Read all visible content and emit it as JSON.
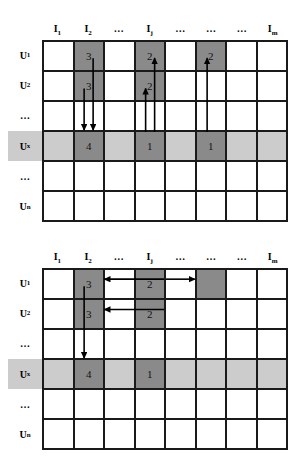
{
  "figure": {
    "colors": {
      "dark_cell": "#8a8a8a",
      "band_highlight": "#cccccc",
      "grid_line": "#1a1a1a",
      "background": "#ffffff",
      "arrow": "#000000"
    }
  },
  "column_headers": [
    {
      "text": "I",
      "sub": "1"
    },
    {
      "text": "I",
      "sub": "2"
    },
    {
      "text": "…",
      "sub": ""
    },
    {
      "text": "I",
      "sub": "j"
    },
    {
      "text": "…",
      "sub": ""
    },
    {
      "text": "…",
      "sub": ""
    },
    {
      "text": "…",
      "sub": ""
    },
    {
      "text": "I",
      "sub": "m"
    }
  ],
  "row_labels": [
    {
      "text": "U",
      "sub": "1",
      "highlight": false
    },
    {
      "text": "U",
      "sub": "2",
      "highlight": false
    },
    {
      "text": "…",
      "sub": "",
      "highlight": false
    },
    {
      "text": "U",
      "sub": "x",
      "highlight": true
    },
    {
      "text": "…",
      "sub": "",
      "highlight": false
    },
    {
      "text": "U",
      "sub": "n",
      "highlight": false
    }
  ],
  "diagrams": [
    {
      "id": "top",
      "name": "user-based-collaborative-filtering",
      "band_row_index": 3,
      "rows": [
        {
          "cells": [
            {
              "value": "",
              "dark": false
            },
            {
              "value": "3",
              "dark": true
            },
            {
              "value": "",
              "dark": false
            },
            {
              "value": "2",
              "dark": true
            },
            {
              "value": "",
              "dark": false
            },
            {
              "value": "2",
              "dark": true
            },
            {
              "value": "",
              "dark": false
            },
            {
              "value": "",
              "dark": false
            }
          ]
        },
        {
          "cells": [
            {
              "value": "",
              "dark": false
            },
            {
              "value": "3",
              "dark": true
            },
            {
              "value": "",
              "dark": false
            },
            {
              "value": "2",
              "dark": true
            },
            {
              "value": "",
              "dark": false
            },
            {
              "value": "",
              "dark": false
            },
            {
              "value": "",
              "dark": false
            },
            {
              "value": "",
              "dark": false
            }
          ]
        },
        {
          "cells": [
            {
              "value": "",
              "dark": false
            },
            {
              "value": "",
              "dark": false
            },
            {
              "value": "",
              "dark": false
            },
            {
              "value": "",
              "dark": false
            },
            {
              "value": "",
              "dark": false
            },
            {
              "value": "",
              "dark": false
            },
            {
              "value": "",
              "dark": false
            },
            {
              "value": "",
              "dark": false
            }
          ]
        },
        {
          "cells": [
            {
              "value": "",
              "dark": false
            },
            {
              "value": "4",
              "dark": true
            },
            {
              "value": "",
              "dark": false
            },
            {
              "value": "1",
              "dark": true
            },
            {
              "value": "",
              "dark": false
            },
            {
              "value": "1",
              "dark": true
            },
            {
              "value": "",
              "dark": false
            },
            {
              "value": "",
              "dark": false
            }
          ]
        },
        {
          "cells": [
            {
              "value": "",
              "dark": false
            },
            {
              "value": "",
              "dark": false
            },
            {
              "value": "",
              "dark": false
            },
            {
              "value": "",
              "dark": false
            },
            {
              "value": "",
              "dark": false
            },
            {
              "value": "",
              "dark": false
            },
            {
              "value": "",
              "dark": false
            },
            {
              "value": "",
              "dark": false
            }
          ]
        },
        {
          "cells": [
            {
              "value": "",
              "dark": false
            },
            {
              "value": "",
              "dark": false
            },
            {
              "value": "",
              "dark": false
            },
            {
              "value": "",
              "dark": false
            },
            {
              "value": "",
              "dark": false
            },
            {
              "value": "",
              "dark": false
            },
            {
              "value": "",
              "dark": false
            },
            {
              "value": "",
              "dark": false
            }
          ]
        }
      ],
      "arrows": [
        {
          "name": "arrow-down-col2-from-u2",
          "direction": "down",
          "from": {
            "col": 2,
            "row": 2
          },
          "to": {
            "col": 2,
            "row": 4
          }
        },
        {
          "name": "arrow-down-col2-from-u1",
          "direction": "down",
          "from": {
            "col": 2,
            "row": 1
          },
          "to": {
            "col": 2,
            "row": 4
          }
        },
        {
          "name": "arrow-up-colj-to-u2",
          "direction": "up",
          "from": {
            "col": 4,
            "row": 4
          },
          "to": {
            "col": 4,
            "row": 2
          }
        },
        {
          "name": "arrow-up-colj-to-u1",
          "direction": "up",
          "from": {
            "col": 4,
            "row": 4
          },
          "to": {
            "col": 4,
            "row": 1
          }
        },
        {
          "name": "arrow-up-col6-to-u1",
          "direction": "up",
          "from": {
            "col": 6,
            "row": 4
          },
          "to": {
            "col": 6,
            "row": 1
          }
        }
      ]
    },
    {
      "id": "bottom",
      "name": "item-based-collaborative-filtering",
      "band_row_index": 3,
      "rows": [
        {
          "cells": [
            {
              "value": "",
              "dark": false
            },
            {
              "value": "3",
              "dark": true
            },
            {
              "value": "",
              "dark": false
            },
            {
              "value": "2",
              "dark": true
            },
            {
              "value": "",
              "dark": false
            },
            {
              "value": "",
              "dark": true
            },
            {
              "value": "",
              "dark": false
            },
            {
              "value": "",
              "dark": false
            }
          ]
        },
        {
          "cells": [
            {
              "value": "",
              "dark": false
            },
            {
              "value": "3",
              "dark": true
            },
            {
              "value": "",
              "dark": false
            },
            {
              "value": "2",
              "dark": true
            },
            {
              "value": "",
              "dark": false
            },
            {
              "value": "",
              "dark": false
            },
            {
              "value": "",
              "dark": false
            },
            {
              "value": "",
              "dark": false
            }
          ]
        },
        {
          "cells": [
            {
              "value": "",
              "dark": false
            },
            {
              "value": "",
              "dark": false
            },
            {
              "value": "",
              "dark": false
            },
            {
              "value": "",
              "dark": false
            },
            {
              "value": "",
              "dark": false
            },
            {
              "value": "",
              "dark": false
            },
            {
              "value": "",
              "dark": false
            },
            {
              "value": "",
              "dark": false
            }
          ]
        },
        {
          "cells": [
            {
              "value": "",
              "dark": false
            },
            {
              "value": "4",
              "dark": true
            },
            {
              "value": "",
              "dark": false
            },
            {
              "value": "1",
              "dark": true
            },
            {
              "value": "",
              "dark": false
            },
            {
              "value": "",
              "dark": false
            },
            {
              "value": "",
              "dark": false
            },
            {
              "value": "",
              "dark": false
            }
          ]
        },
        {
          "cells": [
            {
              "value": "",
              "dark": false
            },
            {
              "value": "",
              "dark": false
            },
            {
              "value": "",
              "dark": false
            },
            {
              "value": "",
              "dark": false
            },
            {
              "value": "",
              "dark": false
            },
            {
              "value": "",
              "dark": false
            },
            {
              "value": "",
              "dark": false
            },
            {
              "value": "",
              "dark": false
            }
          ]
        },
        {
          "cells": [
            {
              "value": "",
              "dark": false
            },
            {
              "value": "",
              "dark": false
            },
            {
              "value": "",
              "dark": false
            },
            {
              "value": "",
              "dark": false
            },
            {
              "value": "",
              "dark": false
            },
            {
              "value": "",
              "dark": false
            },
            {
              "value": "",
              "dark": false
            },
            {
              "value": "",
              "dark": false
            }
          ]
        }
      ],
      "arrows": [
        {
          "name": "arrow-left-u1-colj-to-col2",
          "direction": "left",
          "from": {
            "col": 4,
            "row": 1
          },
          "to": {
            "col": 2,
            "row": 1
          }
        },
        {
          "name": "arrow-right-u1-colj-to-col6",
          "direction": "right",
          "from": {
            "col": 4,
            "row": 1
          },
          "to": {
            "col": 6,
            "row": 1
          }
        },
        {
          "name": "arrow-left-u2-colj-to-col2",
          "direction": "left",
          "from": {
            "col": 4,
            "row": 2
          },
          "to": {
            "col": 2,
            "row": 2
          }
        },
        {
          "name": "arrow-down-col2-from-u1",
          "direction": "down",
          "from": {
            "col": 2,
            "row": 1
          },
          "to": {
            "col": 2,
            "row": 4
          }
        }
      ]
    }
  ]
}
